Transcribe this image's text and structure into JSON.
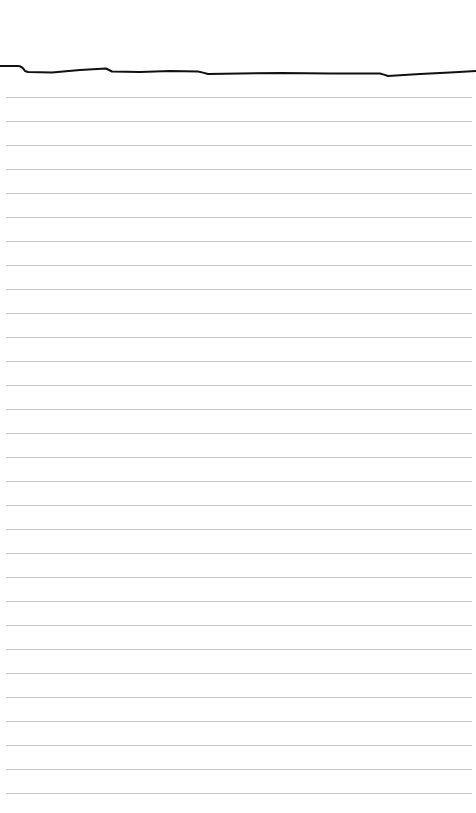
{
  "paper": {
    "background": "#ffffff",
    "rule_color": "#c8c8c8",
    "rule_start_y": 97,
    "rule_spacing": 24,
    "rule_count": 30
  },
  "drawing": {
    "stroke_color": "#111111",
    "stroke_width": 2,
    "path": "M0,66 L18,66 Q22,66 25,71 L28,72 L52,72.5 L80,70 L106,68.5 Q109,70 112,71.5 L140,72 L170,71 L198,71.5 Q203,72.5 208,74 L240,73.5 L282,73 L330,73.5 L380,73.5 Q384,74.5 388,76 L420,74 L450,72.5 L476,71"
  }
}
